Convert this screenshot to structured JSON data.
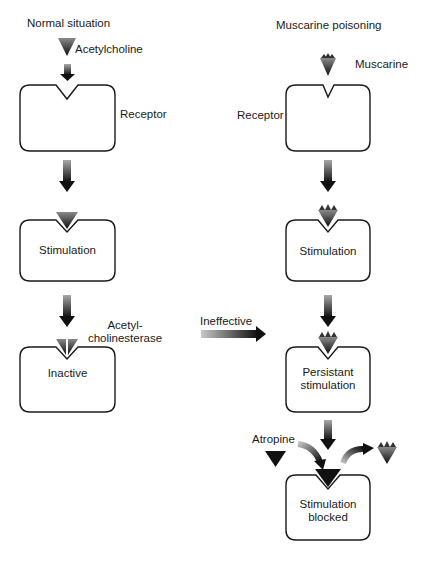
{
  "left": {
    "title": "Normal situation",
    "agonist_label": "Acetylcholine",
    "receptor_label": "Receptor",
    "stimulation_label": "Stimulation",
    "enzyme_label_line1": "Acetyl-",
    "enzyme_label_line2": "cholinesterase",
    "inactive_label": "Inactive"
  },
  "middle": {
    "ineffective_label": "Ineffective"
  },
  "right": {
    "title": "Muscarine poisoning",
    "agonist_label": "Muscarine",
    "receptor_label": "Receptor",
    "stimulation_label": "Stimulation",
    "persistent_line1": "Persistant",
    "persistent_line2": "stimulation",
    "antagonist_label": "Atropine",
    "blocked_line1": "Stimulation",
    "blocked_line2": "blocked"
  },
  "colors": {
    "stroke": "#1a1a1a",
    "arrow_dark": "#111111",
    "arrow_light": "#9a9a9a",
    "muscarine_top": "#6a6a6a"
  }
}
